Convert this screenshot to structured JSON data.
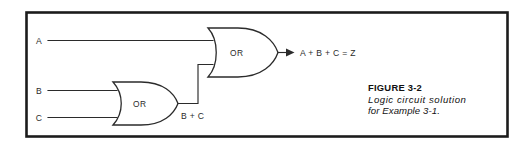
{
  "figure": {
    "caption_title": "FIGURE 3-2",
    "caption_line1": "Logic circuit solution",
    "caption_line2": "for Example 3-1.",
    "border_color": "#1c1c1c",
    "line_color": "#2b2b2b",
    "background": "#ffffff"
  },
  "circuit": {
    "inputs": [
      {
        "label": "A"
      },
      {
        "label": "B"
      },
      {
        "label": "C"
      }
    ],
    "gates": [
      {
        "type": "OR",
        "label": "OR",
        "name": "or-gate-bc"
      },
      {
        "type": "OR",
        "label": "OR",
        "name": "or-gate-output"
      }
    ],
    "intermediate_label": "B + C",
    "output_label": "A + B + C = Z"
  }
}
